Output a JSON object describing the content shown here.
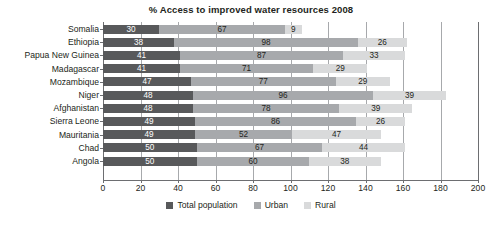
{
  "chart_data": {
    "type": "bar",
    "title": "% Access to improved water resources 2008",
    "xlabel": "",
    "ylabel": "",
    "orientation": "horizontal",
    "stacked": true,
    "grid": true,
    "legend_position": "bottom",
    "xlim": [
      0,
      200
    ],
    "xticks": [
      0,
      20,
      40,
      60,
      80,
      100,
      120,
      140,
      160,
      180,
      200
    ],
    "categories": [
      "Somalia",
      "Ethiopia",
      "Papua New Guinea",
      "Madagascar",
      "Mozambique",
      "Niger",
      "Afghanistan",
      "Sierra Leone",
      "Mauritania",
      "Chad",
      "Angola"
    ],
    "series": [
      {
        "name": "Total population",
        "color": "#58595b",
        "values": [
          30,
          38,
          41,
          41,
          47,
          48,
          48,
          49,
          49,
          50,
          50
        ]
      },
      {
        "name": "Urban",
        "color": "#a7a9ac",
        "values": [
          67,
          98,
          87,
          71,
          77,
          96,
          78,
          86,
          52,
          67,
          60
        ]
      },
      {
        "name": "Rural",
        "color": "#d9dadb",
        "values": [
          9,
          26,
          33,
          29,
          29,
          39,
          39,
          26,
          47,
          44,
          38
        ]
      }
    ]
  },
  "colors": {
    "total_population": "#58595b",
    "urban": "#a7a9ac",
    "rural": "#d9dadb",
    "axis": "#6d6e71",
    "gridline": "#a7a9ac",
    "text": "#231f20",
    "background": "#ffffff"
  }
}
